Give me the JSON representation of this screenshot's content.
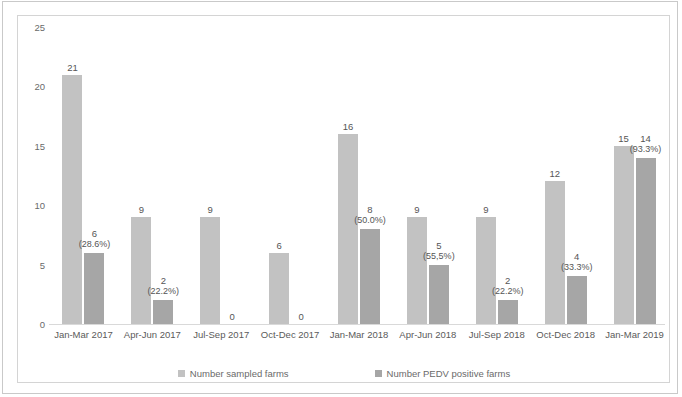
{
  "chart_data": {
    "type": "bar",
    "title": "",
    "xlabel": "",
    "ylabel": "",
    "ylim": [
      0,
      25
    ],
    "yticks": [
      0,
      5,
      10,
      15,
      20,
      25
    ],
    "grid": false,
    "legend_position": "bottom",
    "categories": [
      "Jan-Mar 2017",
      "Apr-Jun 2017",
      "Jul-Sep 2017",
      "Oct-Dec 2017",
      "Jan-Mar 2018",
      "Apr-Jun 2018",
      "Jul-Sep 2018",
      "Oct-Dec 2018",
      "Jan-Mar 2019"
    ],
    "series": [
      {
        "name": "Number sampled farms",
        "color": "#c2c2c2",
        "values": [
          21,
          9,
          9,
          6,
          16,
          9,
          9,
          12,
          15
        ],
        "labels": [
          "21",
          "9",
          "9",
          "6",
          "16",
          "9",
          "9",
          "12",
          "15"
        ]
      },
      {
        "name": "Number PEDV positive farms",
        "color": "#a6a6a6",
        "values": [
          6,
          2,
          0,
          0,
          8,
          5,
          2,
          4,
          14
        ],
        "labels": [
          "6",
          "2",
          "0",
          "0",
          "8",
          "5",
          "2",
          "4",
          "14"
        ],
        "percent_labels": [
          "(28.6%)",
          "(22.2%)",
          "",
          "",
          "(50.0%)",
          "(55,5%)",
          "(22.2%)",
          "(33.3%)",
          "(93.3%)"
        ]
      }
    ]
  },
  "legend": {
    "items": [
      {
        "label": "Number sampled farms",
        "color": "#c2c2c2"
      },
      {
        "label": "Number PEDV positive farms",
        "color": "#a6a6a6"
      }
    ]
  }
}
